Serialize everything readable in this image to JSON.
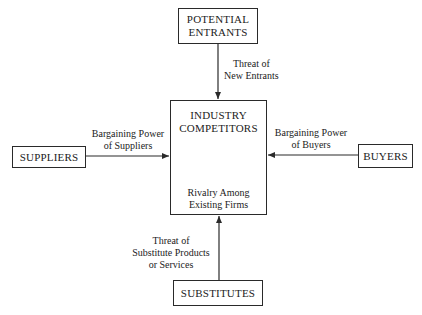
{
  "diagram": {
    "nodes": {
      "top": {
        "line1": "POTENTIAL",
        "line2": "ENTRANTS"
      },
      "center": {
        "line1": "INDUSTRY",
        "line2": "COMPETITORS",
        "sub1": "Rivalry Among",
        "sub2": "Existing Firms"
      },
      "left": {
        "label": "SUPPLIERS"
      },
      "right": {
        "label": "BUYERS"
      },
      "bottom": {
        "label": "SUBSTITUTES"
      }
    },
    "edges": {
      "top": {
        "line1": "Threat of",
        "line2": "New Entrants"
      },
      "left": {
        "line1": "Bargaining Power",
        "line2": "of Suppliers"
      },
      "right": {
        "line1": "Bargaining Power",
        "line2": "of Buyers"
      },
      "bottom": {
        "line1": "Threat of",
        "line2": "Substitute Products",
        "line3": "or Services"
      }
    },
    "colors": {
      "line": "#2a2a2a",
      "text": "#222222",
      "background": "#ffffff"
    }
  }
}
